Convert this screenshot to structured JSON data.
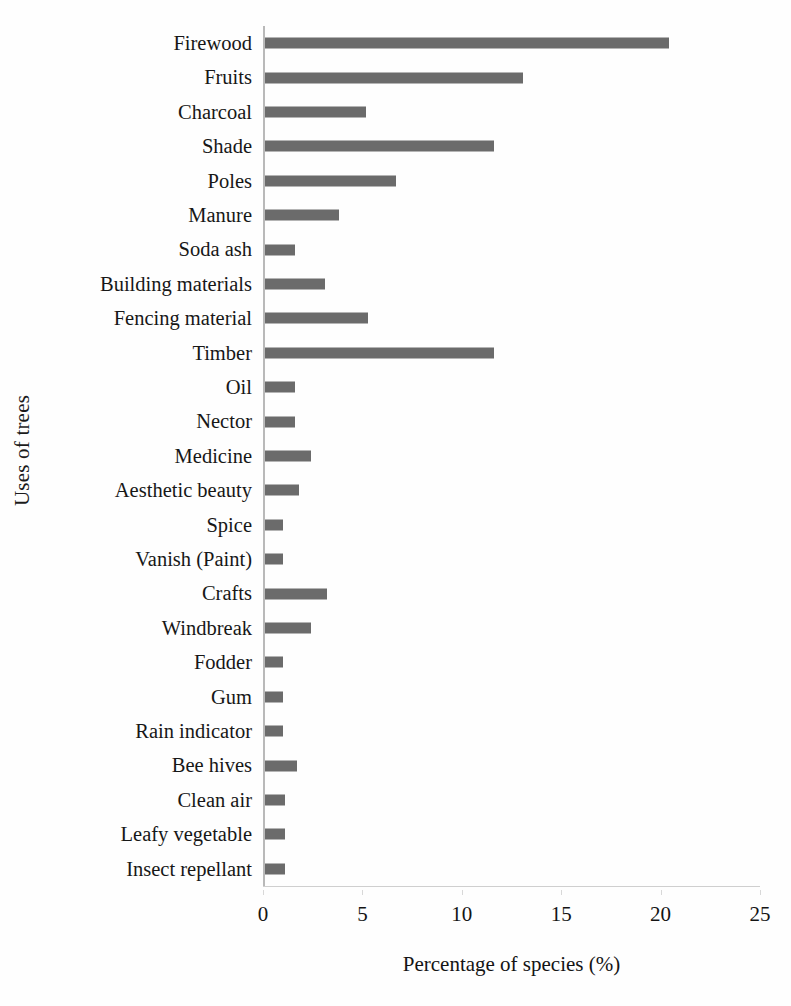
{
  "chart_data": {
    "type": "bar",
    "orientation": "horizontal",
    "title": "",
    "xlabel": "Percentage of species (%)",
    "ylabel": "Uses of trees",
    "xlim": [
      0,
      25
    ],
    "xticks": [
      0,
      5,
      10,
      15,
      20,
      25
    ],
    "xtick_labels": [
      "0",
      "5",
      "10",
      "15",
      "20",
      "25"
    ],
    "grid": false,
    "legend": false,
    "bar_color": "#6b6b6b",
    "categories": [
      "Insect repellant",
      "Leafy vegetable",
      "Clean air",
      "Bee hives",
      "Rain indicator",
      "Gum",
      "Fodder",
      "Windbreak",
      "Crafts",
      "Vanish (Paint)",
      "Spice",
      "Aesthetic beauty",
      "Medicine",
      "Nector",
      "Oil",
      "Timber",
      "Fencing material",
      "Building materials",
      "Soda ash",
      "Manure",
      "Poles",
      "Shade",
      "Charcoal",
      "Fruits",
      "Firewood"
    ],
    "values": [
      1.1,
      1.1,
      1.1,
      1.7,
      1.0,
      1.0,
      1.0,
      2.4,
      3.2,
      1.0,
      1.0,
      1.8,
      2.4,
      1.6,
      1.6,
      11.6,
      5.3,
      3.1,
      1.6,
      3.8,
      6.7,
      11.6,
      5.2,
      13.1,
      20.4
    ],
    "ylabel_note": "Categories are listed bottom-to-top starting from Firewood"
  }
}
